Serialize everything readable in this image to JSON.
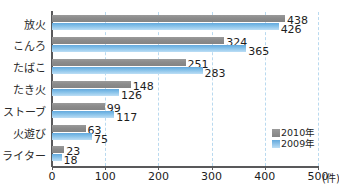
{
  "chart_data": {
    "type": "bar",
    "orientation": "horizontal",
    "title": "",
    "categories": [
      "放火",
      "こんろ",
      "たばこ",
      "たき火",
      "ストーブ",
      "火遊び",
      "ライター"
    ],
    "series": [
      {
        "name": "2010年",
        "color": "#8b8b8b",
        "values": [
          438,
          324,
          251,
          148,
          99,
          63,
          23
        ]
      },
      {
        "name": "2009年",
        "color": "#82bfe8",
        "values": [
          426,
          365,
          283,
          126,
          117,
          75,
          18
        ]
      }
    ],
    "xlabel": "",
    "ylabel": "",
    "unit": "(件)",
    "xlim": [
      0,
      500
    ],
    "xticks": [
      0,
      100,
      200,
      300,
      400,
      500
    ],
    "xtick_labels": [
      "0",
      "100",
      "200",
      "300",
      "400",
      "500"
    ],
    "grid": true,
    "grid_style": "dashed",
    "grid_color": "#b9d9ef",
    "legend_position": "bottom-right"
  },
  "legend": {
    "items": [
      {
        "label": "2010年"
      },
      {
        "label": "2009年"
      }
    ]
  },
  "axis": {
    "unit_label": "(件)"
  }
}
